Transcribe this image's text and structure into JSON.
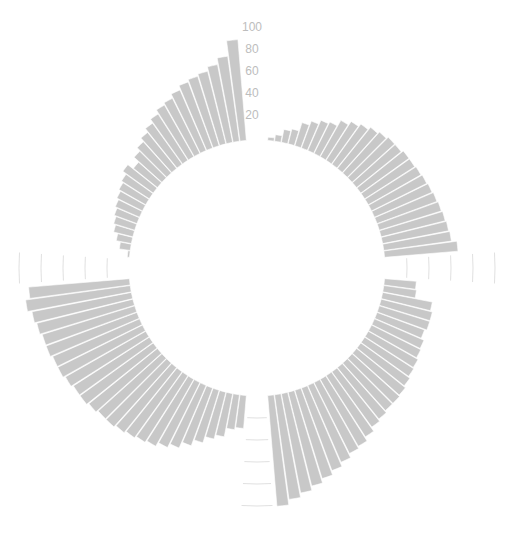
{
  "chart_data": {
    "type": "bar",
    "subtype": "circular",
    "title": "",
    "xlabel": "",
    "ylabel": "",
    "ylim": [
      0,
      100
    ],
    "yticks": [
      20,
      40,
      60,
      80,
      100
    ],
    "ytick_labels": [
      "20",
      "40",
      "60",
      "80",
      "100"
    ],
    "grid": true,
    "legend": null,
    "bar_color": "#c8c8c8",
    "grid_color": "#d8d8d8",
    "label_color": "#bdbdbd",
    "gap_slots": 3,
    "series": [
      {
        "name": "Group A",
        "values": [
          3,
          6,
          12,
          14,
          22,
          26,
          30,
          32,
          38,
          42,
          45,
          48,
          50,
          52,
          52,
          54,
          54,
          55,
          56,
          57,
          58,
          59,
          60,
          61,
          62,
          67
        ]
      },
      {
        "name": "Group B",
        "values": [
          29,
          30,
          46,
          48,
          48,
          46,
          49,
          50,
          52,
          53,
          55,
          57,
          58,
          58,
          60,
          62,
          66,
          70,
          72,
          76,
          80,
          84,
          88,
          92,
          96,
          101
        ]
      },
      {
        "name": "Group C",
        "values": [
          30,
          32,
          40,
          44,
          50,
          56,
          62,
          66,
          70,
          72,
          74,
          76,
          78,
          78,
          80,
          82,
          82,
          84,
          86,
          86,
          88,
          88,
          90,
          92,
          96,
          92
        ]
      },
      {
        "name": "Group D",
        "values": [
          2,
          10,
          14,
          18,
          20,
          22,
          24,
          26,
          28,
          30,
          34,
          28,
          34,
          38,
          42,
          46,
          50,
          54,
          56,
          60,
          64,
          66,
          68,
          72,
          78,
          92
        ]
      }
    ]
  },
  "axis": {
    "labels": [
      "100",
      "80",
      "60",
      "40",
      "20"
    ]
  }
}
